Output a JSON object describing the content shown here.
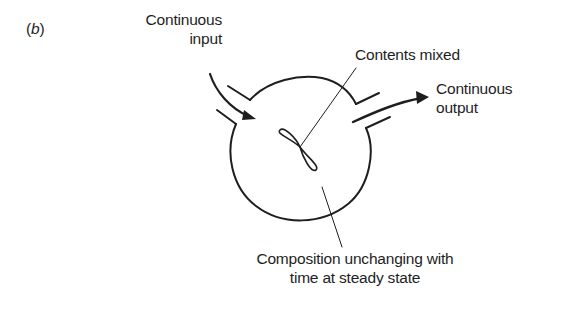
{
  "figure": {
    "panel_label": "b"
  },
  "labels": {
    "input_line1": "Continuous",
    "input_line2": "input",
    "mixed": "Contents mixed",
    "output_line1": "Continuous",
    "output_line2": "output",
    "composition_line1": "Composition unchanging with",
    "composition_line2": "time at steady state"
  },
  "colors": {
    "stroke": "#1e1e1e",
    "background": "#ffffff"
  }
}
